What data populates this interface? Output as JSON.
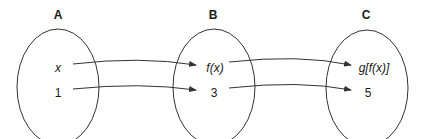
{
  "sets": [
    {
      "label": "A",
      "elements": [
        "x",
        "1"
      ]
    },
    {
      "label": "B",
      "elements": [
        "f(x)",
        "3"
      ]
    },
    {
      "label": "C",
      "elements": [
        "g[f(x)]",
        "5"
      ]
    }
  ],
  "mappings": [
    {
      "from": "x",
      "to": "f(x)"
    },
    {
      "from": "1",
      "to": "3"
    },
    {
      "from": "f(x)",
      "to": "g[f(x)]"
    },
    {
      "from": "3",
      "to": "5"
    }
  ],
  "colors": {
    "stroke": "#333333",
    "text": "#1a1a1a",
    "background": "#ffffff"
  }
}
